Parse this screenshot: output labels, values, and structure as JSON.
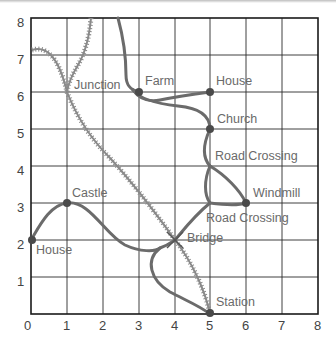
{
  "map": {
    "grid": {
      "x_min": 0,
      "x_max": 8,
      "y_min": 0,
      "y_max": 8
    },
    "x_ticks": [
      "0",
      "1",
      "2",
      "3",
      "4",
      "5",
      "6",
      "7",
      "8"
    ],
    "y_ticks": [
      "0",
      "1",
      "2",
      "3",
      "4",
      "5",
      "6",
      "7",
      "8"
    ],
    "places": [
      {
        "name": "Farm",
        "x": 3,
        "y": 6
      },
      {
        "name": "House",
        "x": 5,
        "y": 6
      },
      {
        "name": "Church",
        "x": 5,
        "y": 5
      },
      {
        "name": "Windmill",
        "x": 6,
        "y": 3
      },
      {
        "name": "Castle",
        "x": 1,
        "y": 3
      },
      {
        "name": "House",
        "x": 0,
        "y": 2
      },
      {
        "name": "Station",
        "x": 5,
        "y": 0
      }
    ],
    "junctions": [
      {
        "name": "Junction",
        "x": 1,
        "y": 6,
        "type": "railway"
      },
      {
        "name": "Road Crossing",
        "x": 5,
        "y": 4,
        "type": "road"
      },
      {
        "name": "Road Crossing",
        "x": 5,
        "y": 3,
        "type": "road"
      },
      {
        "name": "Bridge",
        "x": 4,
        "y": 2,
        "type": "road-railway"
      }
    ],
    "legend": {
      "road_color": "#6b6b6b",
      "railway_color": "#8a8a8a",
      "grid_color": "#2a2a2a"
    }
  }
}
